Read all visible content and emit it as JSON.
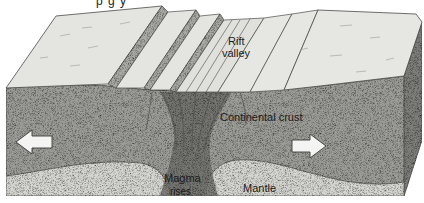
{
  "diagram": {
    "title_fragment": "p      g     y",
    "labels": {
      "rift_valley_line1": "Rift",
      "rift_valley_line2": "valley",
      "continental_crust": "Continental crust",
      "magma_line1": "Magma",
      "magma_line2": "rises",
      "mantle": "Mantle"
    },
    "arrows": [
      {
        "direction": "left",
        "meaning": "plate moves apart (west)"
      },
      {
        "direction": "right",
        "meaning": "plate moves apart (east)"
      }
    ],
    "colors": {
      "surface": "#e4e4e0",
      "crust_front": "#9c9c98",
      "crust_side": "#7e7e7a",
      "mantle": "#d6d6d2",
      "magma": "#6e6e6a",
      "fault_block_face": "#a9a9a5",
      "outline": "#4a4a48",
      "arrow_fill": "#f4f4f2"
    }
  }
}
